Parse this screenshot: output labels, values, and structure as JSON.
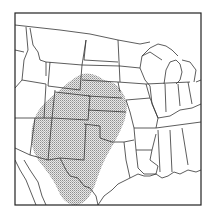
{
  "map": {
    "region": "Central United States",
    "frame": {
      "x": 15,
      "y": 13,
      "width": 186,
      "height": 192
    },
    "colors": {
      "background": "#ffffff",
      "border": "#222222",
      "state_line": "#333333",
      "shading": "#9a9a9a"
    },
    "shaded_area": {
      "pattern": "stipple",
      "covers": [
        "Colorado",
        "New Mexico",
        "Kansas",
        "Oklahoma",
        "Texas",
        "Nebraska",
        "Wyoming",
        "Arizona"
      ]
    },
    "labels": []
  }
}
